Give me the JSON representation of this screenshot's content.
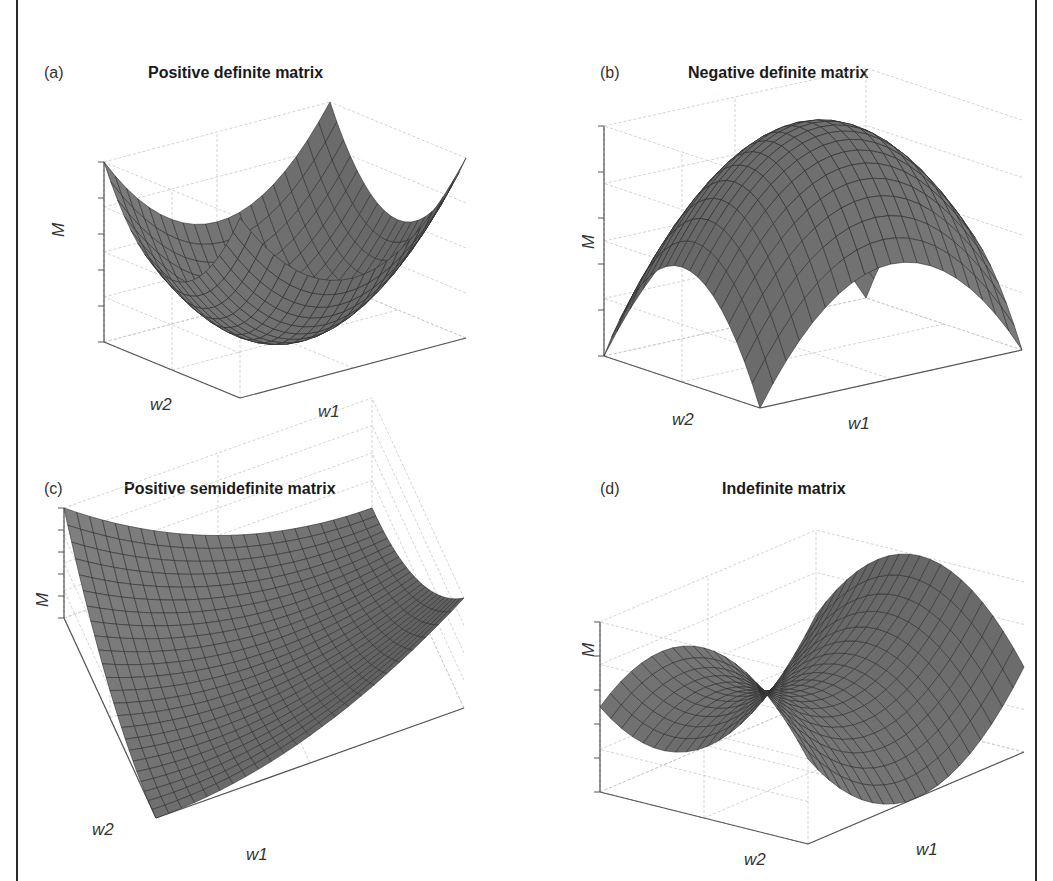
{
  "figure": {
    "colors": {
      "surface": "#6e6e6e",
      "surface_light": "#8a8a8a",
      "surface_dark": "#4a4a4a",
      "mesh_line": "#2e2e2e",
      "grid": "#c8c8c8",
      "axis": "#555555",
      "border": "#2a2a2a"
    }
  },
  "panels": [
    {
      "label": "(a)",
      "title": "Positive definite matrix",
      "xlabel": "w1",
      "ylabel": "w2",
      "zlabel": "M",
      "function": "w1^2 + w2^2"
    },
    {
      "label": "(b)",
      "title": "Negative definite matrix",
      "xlabel": "w1",
      "ylabel": "w2",
      "zlabel": "M",
      "function": "-(w1^2 + w2^2)"
    },
    {
      "label": "(c)",
      "title": "Positive semidefinite matrix",
      "xlabel": "w1",
      "ylabel": "w2",
      "zlabel": "M",
      "function": "(w1 - w2)^2"
    },
    {
      "label": "(d)",
      "title": "Indefinite matrix",
      "xlabel": "w1",
      "ylabel": "w2",
      "zlabel": "M",
      "function": "w1^2 - w2^2"
    }
  ],
  "chart_data": [
    {
      "type": "surface",
      "title": "Positive definite matrix",
      "panel_label": "(a)",
      "xlabel": "w1",
      "ylabel": "w2",
      "zlabel": "M",
      "function": "M = w1^2 + w2^2",
      "x_range": [
        -1,
        1
      ],
      "y_range": [
        -1,
        1
      ],
      "grid_n": 21,
      "shape": "bowl (single minimum at center)",
      "grid": true
    },
    {
      "type": "surface",
      "title": "Negative definite matrix",
      "panel_label": "(b)",
      "xlabel": "w1",
      "ylabel": "w2",
      "zlabel": "M",
      "function": "M = -(w1^2 + w2^2)",
      "x_range": [
        -1,
        1
      ],
      "y_range": [
        -1,
        1
      ],
      "grid_n": 21,
      "shape": "dome (single maximum at center)",
      "grid": true
    },
    {
      "type": "surface",
      "title": "Positive semidefinite matrix",
      "panel_label": "(c)",
      "xlabel": "w1",
      "ylabel": "w2",
      "zlabel": "M",
      "function": "M = (w1 - w2)^2",
      "x_range": [
        -1,
        1
      ],
      "y_range": [
        -1,
        1
      ],
      "grid_n": 25,
      "shape": "trough (zero along a line)",
      "grid": true
    },
    {
      "type": "surface",
      "title": "Indefinite matrix",
      "panel_label": "(d)",
      "xlabel": "w1",
      "ylabel": "w2",
      "zlabel": "M",
      "function": "M = w1^2 - w2^2",
      "x_range": [
        -1,
        1
      ],
      "y_range": [
        -1,
        1
      ],
      "grid_n": 21,
      "shape": "saddle",
      "grid": true
    }
  ]
}
